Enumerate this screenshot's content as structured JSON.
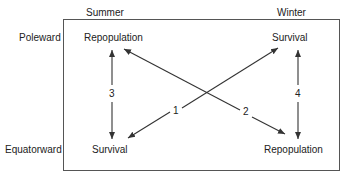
{
  "columns": {
    "summer": "Summer",
    "winter": "Winter"
  },
  "rows": {
    "poleward": "Poleward",
    "equatorward": "Equatorward"
  },
  "nodes": {
    "summer_poleward": "Repopulation",
    "winter_poleward": "Survival",
    "summer_equatorward": "Survival",
    "winter_equatorward": "Repopulation"
  },
  "arrows": {
    "a1": "1",
    "a2": "2",
    "a3": "3",
    "a4": "4"
  },
  "colors": {
    "line": "#333333",
    "text": "#222222"
  }
}
